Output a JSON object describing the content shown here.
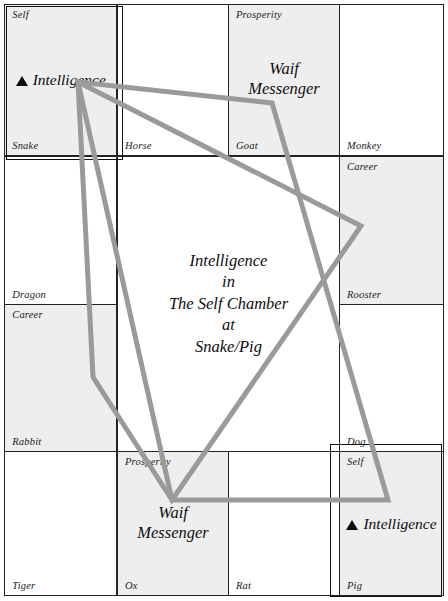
{
  "chart": {
    "title_lines": [
      "Intelligence",
      "in",
      "The Self Chamber",
      "at",
      "Snake/Pig"
    ],
    "accent_color": "#999999",
    "grid_color": "#232323",
    "shade_color": "#eeeeee",
    "highlight_color": "#101010"
  },
  "cells": [
    {
      "branch": "Snake",
      "chamber": "Self",
      "stars": [],
      "marker": "▲",
      "marker_star": "Intelligence",
      "shaded": true,
      "highlighted": true
    },
    {
      "branch": "Horse",
      "chamber": "",
      "stars": [],
      "marker": "",
      "marker_star": "",
      "shaded": false,
      "highlighted": false
    },
    {
      "branch": "Goat",
      "chamber": "Prosperity",
      "stars": [
        "Waif",
        "Messenger"
      ],
      "marker": "",
      "marker_star": "",
      "shaded": true,
      "highlighted": false
    },
    {
      "branch": "Monkey",
      "chamber": "",
      "stars": [],
      "marker": "",
      "marker_star": "",
      "shaded": false,
      "highlighted": false
    },
    {
      "branch": "Dragon",
      "chamber": "",
      "stars": [],
      "marker": "",
      "marker_star": "",
      "shaded": false,
      "highlighted": false
    },
    {
      "branch": "Rooster",
      "chamber": "Career",
      "stars": [],
      "marker": "",
      "marker_star": "",
      "shaded": true,
      "highlighted": false
    },
    {
      "branch": "Rabbit",
      "chamber": "Career",
      "stars": [],
      "marker": "",
      "marker_star": "",
      "shaded": true,
      "highlighted": false
    },
    {
      "branch": "Dog",
      "chamber": "",
      "stars": [],
      "marker": "",
      "marker_star": "",
      "shaded": false,
      "highlighted": false
    },
    {
      "branch": "Tiger",
      "chamber": "",
      "stars": [],
      "marker": "",
      "marker_star": "",
      "shaded": false,
      "highlighted": false
    },
    {
      "branch": "Ox",
      "chamber": "Prosperity",
      "stars": [
        "Waif",
        "Messenger"
      ],
      "marker": "",
      "marker_star": "",
      "shaded": true,
      "highlighted": false
    },
    {
      "branch": "Rat",
      "chamber": "",
      "stars": [],
      "marker": "",
      "marker_star": "",
      "shaded": false,
      "highlighted": false
    },
    {
      "branch": "Pig",
      "chamber": "Self",
      "stars": [],
      "marker": "▲",
      "marker_star": "Intelligence",
      "shaded": true,
      "highlighted": true
    }
  ]
}
